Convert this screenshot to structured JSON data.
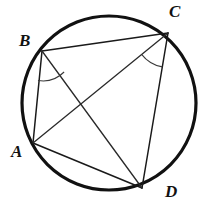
{
  "figure": {
    "type": "geometry-diagram",
    "canvas": {
      "width": 213,
      "height": 207
    },
    "background_color": "#ffffff",
    "stroke_color": "#111111"
  },
  "circle": {
    "name": "circumscribed-circle",
    "center_x": 109,
    "center_y": 103,
    "radius": 87,
    "stroke_width": 3.2
  },
  "points": [
    {
      "id": "A",
      "label": "A",
      "x": 33,
      "y": 143,
      "label_x": 11,
      "label_y": 143
    },
    {
      "id": "B",
      "label": "B",
      "x": 42,
      "y": 51,
      "label_x": 19,
      "label_y": 32
    },
    {
      "id": "C",
      "label": "C",
      "x": 168,
      "y": 33,
      "label_x": 169,
      "label_y": 3
    },
    {
      "id": "D",
      "label": "D",
      "x": 142,
      "y": 188,
      "label_x": 165,
      "label_y": 183
    }
  ],
  "segments": [
    {
      "id": "BC",
      "from": "B",
      "to": "C",
      "kind": "side",
      "x1": 42,
      "y1": 51,
      "x2": 168,
      "y2": 33
    },
    {
      "id": "AB",
      "from": "A",
      "to": "B",
      "kind": "side",
      "x1": 33,
      "y1": 143,
      "x2": 42,
      "y2": 51
    },
    {
      "id": "AD",
      "from": "A",
      "to": "D",
      "kind": "side",
      "x1": 33,
      "y1": 143,
      "x2": 142,
      "y2": 188
    },
    {
      "id": "CD",
      "from": "C",
      "to": "D",
      "kind": "side",
      "x1": 168,
      "y1": 33,
      "x2": 142,
      "y2": 188
    },
    {
      "id": "AC",
      "from": "A",
      "to": "C",
      "kind": "diagonal",
      "x1": 33,
      "y1": 143,
      "x2": 168,
      "y2": 33
    },
    {
      "id": "BD",
      "from": "B",
      "to": "D",
      "kind": "diagonal",
      "x1": 42,
      "y1": 51,
      "x2": 142,
      "y2": 188
    }
  ],
  "angle_marks": [
    {
      "id": "angle-at-B",
      "vertex": "B",
      "between": [
        "BA",
        "BD"
      ],
      "arc_path": "M 38.0 80.5 A 30 30 0 0 0 64.1 72.0",
      "description": "arc marking inscribed angle ABD at vertex B"
    },
    {
      "id": "angle-at-C",
      "vertex": "C",
      "between": [
        "CA",
        "CD"
      ],
      "arc_path": "M 141.6 54.3 A 34 34 0 0 0 162.3 66.9",
      "description": "arc marking inscribed angle ACD at vertex C"
    }
  ]
}
